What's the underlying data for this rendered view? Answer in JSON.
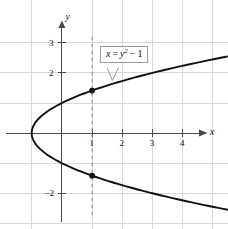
{
  "figure": {
    "background_color": "#ffffff",
    "grid_color": "#d8d8dc",
    "axis_color": "#4a4a4a",
    "curve_color": "#111111",
    "dashed_line_color": "#8a8a8a",
    "point_color": "#111111",
    "callout_border_color": "#9a9a9a"
  },
  "axes": {
    "x_axis_label": "x",
    "y_axis_label": "y",
    "x_tick_labels": [
      "1",
      "2",
      "3",
      "4"
    ],
    "y_tick_labels": [
      "3",
      "2",
      "−2"
    ],
    "x_tick_values": [
      1,
      2,
      3,
      4
    ],
    "y_tick_values": [
      3,
      2,
      -2
    ]
  },
  "callout": {
    "equation_lhs": "x",
    "equation_eq": "=",
    "equation_var": "y",
    "equation_exponent": "2",
    "equation_minus": "−",
    "equation_const": "1",
    "equation_plain": "x = y² − 1"
  },
  "chart_data": {
    "type": "line",
    "xlabel": "x",
    "ylabel": "y",
    "xlim": [
      -1.9,
      4.85
    ],
    "ylim": [
      -2.9,
      3.55
    ],
    "grid": true,
    "legend": "none",
    "relation": "x = y^2 - 1",
    "vertex": [
      -1,
      0
    ],
    "opens": "right",
    "series": [
      {
        "name": "x = y² − 1 (upper branch)",
        "x": [
          -1,
          -0.75,
          -0.5,
          0,
          0.5,
          1,
          1.5,
          2,
          2.5,
          3,
          3.5,
          4,
          4.6
        ],
        "y": [
          0,
          0.5,
          0.707,
          1,
          1.225,
          1.414,
          1.581,
          1.732,
          1.871,
          2,
          2.121,
          2.236,
          2.366
        ]
      },
      {
        "name": "x = y² − 1 (lower branch)",
        "x": [
          -1,
          -0.75,
          -0.5,
          0,
          0.5,
          1,
          1.5,
          2,
          2.5,
          3,
          3.5,
          4,
          4.6
        ],
        "y": [
          0,
          -0.5,
          -0.707,
          -1,
          -1.225,
          -1.414,
          -1.581,
          -1.732,
          -1.871,
          -2,
          -2.121,
          -2.236,
          -2.366
        ]
      }
    ],
    "marked_points": [
      {
        "x": 1,
        "y": 1.414,
        "label": "(1, √2)"
      },
      {
        "x": 1,
        "y": -1.414,
        "label": "(1, −√2)"
      }
    ],
    "vertical_dashed_line": {
      "x": 1,
      "y_from": -2.85,
      "y_to": 3.2
    },
    "annotations": [
      {
        "text": "x = y² − 1",
        "type": "boxed-callout",
        "points_to": [
          1.95,
          1.72
        ]
      }
    ]
  }
}
